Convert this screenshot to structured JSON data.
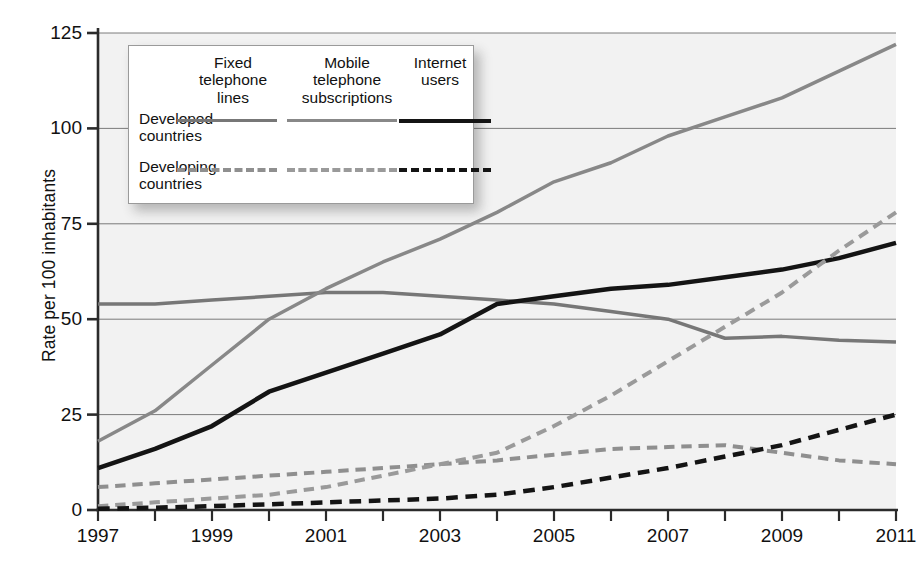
{
  "chart_data": {
    "type": "line",
    "title": "",
    "xlabel": "",
    "ylabel": "Rate per 100 inhabitants",
    "xlim": [
      1997,
      2011
    ],
    "ylim": [
      0,
      125
    ],
    "yticks": [
      0,
      25,
      50,
      75,
      100,
      125
    ],
    "ytick_labels": [
      "0",
      "25",
      "50",
      "75",
      "100",
      "125"
    ],
    "x": [
      1997,
      1998,
      1999,
      2000,
      2001,
      2002,
      2003,
      2004,
      2005,
      2006,
      2007,
      2008,
      2009,
      2010,
      2011
    ],
    "xticks": [
      1997,
      1998,
      1999,
      2000,
      2001,
      2002,
      2003,
      2004,
      2005,
      2006,
      2007,
      2008,
      2009,
      2010,
      2011
    ],
    "xtick_labels": [
      "1997",
      "",
      "1999",
      "",
      "2001",
      "",
      "2003",
      "",
      "2005",
      "",
      "2007",
      "",
      "2009",
      "",
      "2011"
    ],
    "grid": "horizontal",
    "legend_position": "upper-left-inside",
    "plot_background": "#f2f2f2",
    "series": [
      {
        "name": "Fixed telephone lines - Developed countries",
        "group": "Developed countries",
        "category": "Fixed telephone lines",
        "color": "#777777",
        "style": "solid",
        "width": 3.5,
        "values": [
          54,
          54,
          55,
          56,
          57,
          57,
          56,
          55,
          54,
          52,
          50,
          45,
          45.5,
          44.5,
          44
        ]
      },
      {
        "name": "Mobile telephone subscriptions - Developed countries",
        "group": "Developed countries",
        "category": "Mobile telephone subscriptions",
        "color": "#888888",
        "style": "solid",
        "width": 3.5,
        "values": [
          18,
          26,
          38,
          50,
          58,
          65,
          71,
          78,
          86,
          91,
          98,
          103,
          108,
          115,
          122
        ]
      },
      {
        "name": "Internet users - Developed countries",
        "group": "Developed countries",
        "category": "Internet users",
        "color": "#141414",
        "style": "solid",
        "width": 4.5,
        "values": [
          11,
          16,
          22,
          31,
          36,
          41,
          46,
          54,
          56,
          58,
          59,
          61,
          63,
          66,
          70
        ]
      },
      {
        "name": "Fixed telephone lines - Developing countries",
        "group": "Developing countries",
        "category": "Fixed telephone lines",
        "color": "#8f8f8f",
        "style": "dashed",
        "width": 4,
        "values": [
          6,
          7,
          8,
          9,
          10,
          11,
          12,
          13,
          14.5,
          16,
          16.5,
          17,
          15,
          13,
          12
        ]
      },
      {
        "name": "Mobile telephone subscriptions - Developing countries",
        "group": "Developing countries",
        "category": "Mobile telephone subscriptions",
        "color": "#9a9a9a",
        "style": "dashed",
        "width": 4,
        "values": [
          1,
          2,
          3,
          4,
          6,
          9,
          12,
          15,
          22,
          30,
          39,
          48,
          57,
          68,
          78
        ]
      },
      {
        "name": "Internet users - Developing countries",
        "group": "Developing countries",
        "category": "Internet users",
        "color": "#141414",
        "style": "dashed",
        "width": 4.5,
        "values": [
          0.3,
          0.6,
          1,
          1.5,
          2,
          2.5,
          3,
          4,
          6,
          8.5,
          11,
          14,
          17,
          21,
          25
        ]
      }
    ]
  },
  "axis": {
    "y_title": "Rate per 100 inhabitants"
  },
  "legend": {
    "columns": [
      "Fixed\ntelephone\nlines",
      "Mobile\ntelephone\nsubscriptions",
      "Internet\nusers"
    ],
    "column_labels": {
      "fixed": "Fixed telephone lines",
      "mobile": "Mobile telephone subscriptions",
      "internet": "Internet users"
    },
    "rows": [
      "Developed countries",
      "Developing countries"
    ],
    "row_labels": {
      "developed_line1": "Developed",
      "developed_line2": "countries",
      "developing_line1": "Developing",
      "developing_line2": "countries"
    },
    "col1_line1": "Fixed",
    "col1_line2": "telephone",
    "col1_line3": "lines",
    "col2_line1": "Mobile",
    "col2_line2": "telephone",
    "col2_line3": "subscriptions",
    "col3_line1": "Internet",
    "col3_line2": "users"
  }
}
